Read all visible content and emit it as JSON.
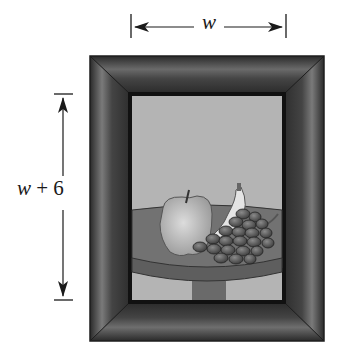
{
  "diagram": {
    "width_label": "w",
    "height_label_var": "w",
    "height_label_rest": " + 6",
    "picture_subject": "still life: apple, banana, grapes on a round table",
    "colors": {
      "frame_dark": "#2e2e2e",
      "frame_mid": "#5a5a5a",
      "frame_highlight": "#8a8a8a",
      "wall": "#b4b4b4",
      "table": "#6e6e6e",
      "apple": "#c8c8c8",
      "banana": "#e6e6e6",
      "grapes": "#555555",
      "dimension_lines": "#1a1a1a"
    }
  }
}
